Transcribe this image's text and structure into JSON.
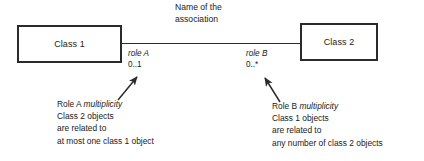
{
  "diagram": {
    "type": "uml-class-association",
    "background_color": "#ffffff",
    "line_color": "#2b2b2b",
    "text_color": "#1a1a1a",
    "classes": [
      {
        "id": "class-1",
        "label": "Class 1"
      },
      {
        "id": "class-2",
        "label": "Class 2"
      }
    ],
    "association": {
      "name_line_1": "Name of the",
      "name_line_2": "association"
    },
    "roles": [
      {
        "id": "role-a",
        "name": "role A",
        "multiplicity": "0..1"
      },
      {
        "id": "role-b",
        "name": "role B",
        "multiplicity": "0..*"
      }
    ],
    "annotations": [
      {
        "id": "annotation-left",
        "target": "role-a",
        "line_1_prefix": "Role A ",
        "line_1_emph": "multiplicity",
        "line_2": "Class 2 objects",
        "line_3": "are related to",
        "line_4": "at most one class 1 object"
      },
      {
        "id": "annotation-right",
        "target": "role-b",
        "line_1_prefix": "Role B ",
        "line_1_emph": "multiplicity",
        "line_2": "Class 1 objects",
        "line_3": "are related to",
        "line_4": "any number of class 2 objects"
      }
    ]
  }
}
